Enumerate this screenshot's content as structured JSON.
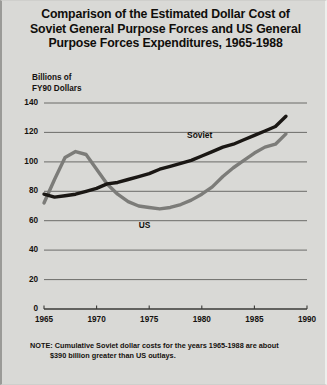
{
  "title": "Comparison of the Estimated Dollar Cost of Soviet General Purpose Forces and US General Purpose Forces Expenditures, 1965-1988",
  "title_lines": [
    "Comparison of the Estimated Dollar Cost of",
    "Soviet General Purpose Forces and US General",
    "Purpose Forces Expenditures, 1965-1988"
  ],
  "axis_label_lines": [
    "Billions of",
    "FY90 Dollars"
  ],
  "note": {
    "line1": "NOTE: Cumulative Soviet dollar costs for the years 1965-1988 are about",
    "line2": "$390 billion greater than US outlays."
  },
  "colors": {
    "background": "#d9d9d6",
    "soviet_line": "#1a1714",
    "us_line": "#7c7c79",
    "gridline": "#5f5f5c",
    "axis": "#3a3a37",
    "text": "#15120f"
  },
  "chart_data": {
    "type": "line",
    "title": "Comparison of the Estimated Dollar Cost of Soviet General Purpose Forces and US General Purpose Forces Expenditures, 1965-1988",
    "xlabel": "",
    "ylabel": "Billions of FY90 Dollars",
    "xlim": [
      1965,
      1990
    ],
    "ylim": [
      0,
      140
    ],
    "yticks": [
      0,
      20,
      40,
      60,
      80,
      100,
      120,
      140
    ],
    "xticks": [
      1965,
      1970,
      1975,
      1980,
      1985,
      1990
    ],
    "grid": true,
    "legend": "inline-labels",
    "x": [
      1965,
      1966,
      1967,
      1968,
      1969,
      1970,
      1971,
      1972,
      1973,
      1974,
      1975,
      1976,
      1977,
      1978,
      1979,
      1980,
      1981,
      1982,
      1983,
      1984,
      1985,
      1986,
      1987,
      1988
    ],
    "series": [
      {
        "name": "Soviet",
        "label": "Soviet",
        "color": "#1a1714",
        "values": [
          78,
          76,
          77,
          78,
          80,
          82,
          85,
          86,
          88,
          90,
          92,
          95,
          97,
          99,
          101,
          104,
          107,
          110,
          112,
          115,
          118,
          121,
          124,
          131
        ]
      },
      {
        "name": "US",
        "label": "US",
        "color": "#7c7c79",
        "values": [
          72,
          88,
          103,
          107,
          105,
          95,
          85,
          78,
          73,
          70,
          69,
          68,
          69,
          71,
          74,
          78,
          83,
          90,
          96,
          101,
          106,
          110,
          112,
          119
        ]
      }
    ]
  }
}
